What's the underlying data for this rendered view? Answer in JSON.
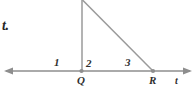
{
  "figure": {
    "colors": {
      "line": "#8e8e8e",
      "point": "#8e8e8e",
      "text": "#2f2f2f",
      "background": "#ffffff"
    },
    "corner_fragment": "t.",
    "axis": {
      "name": "t",
      "left_arrow": "arrow-left",
      "right_arrow": "arrow-right"
    },
    "points": [
      {
        "id": "Q",
        "label": "Q",
        "x": 81,
        "y": 71
      },
      {
        "id": "R",
        "label": "R",
        "x": 153,
        "y": 71
      }
    ],
    "angles": [
      {
        "id": "angle-1",
        "label": "1",
        "x": 57,
        "y": 63
      },
      {
        "id": "angle-2",
        "label": "2",
        "x": 89,
        "y": 64
      },
      {
        "id": "angle-3",
        "label": "3",
        "x": 128,
        "y": 63
      }
    ],
    "segments": [
      {
        "id": "ray-axis",
        "x1": 6,
        "y1": 71,
        "x2": 190,
        "y2": 71
      },
      {
        "id": "vertical-at-q",
        "x1": 82,
        "y1": 1,
        "x2": 82,
        "y2": 71
      },
      {
        "id": "hypotenuse-q-r",
        "x1": 83,
        "y1": 1,
        "x2": 153,
        "y2": 71
      }
    ]
  }
}
